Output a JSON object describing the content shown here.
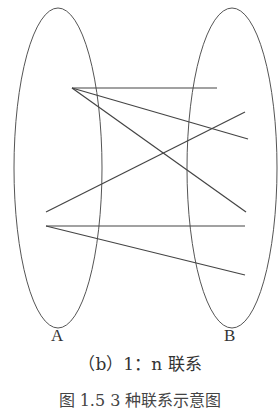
{
  "diagram": {
    "sets": [
      {
        "label": "A",
        "cx": 58,
        "cy": 168,
        "rx": 44,
        "ry": 160
      },
      {
        "label": "B",
        "cx": 232,
        "cy": 168,
        "rx": 45,
        "ry": 160
      }
    ],
    "edges": [
      {
        "from": [
          72,
          88
        ],
        "to": [
          217,
          88
        ]
      },
      {
        "from": [
          72,
          88
        ],
        "to": [
          248,
          139
        ]
      },
      {
        "from": [
          72,
          88
        ],
        "to": [
          246,
          212
        ]
      },
      {
        "from": [
          46,
          212
        ],
        "to": [
          245,
          112
        ]
      },
      {
        "from": [
          46,
          226
        ],
        "to": [
          245,
          226
        ]
      },
      {
        "from": [
          46,
          226
        ],
        "to": [
          245,
          275
        ]
      }
    ],
    "line_color": "#444444"
  },
  "labels": {
    "a": "A",
    "b": "B"
  },
  "caption": "（b）1：n 联系",
  "figure_caption": "图 1.5  3 种联系示意图"
}
